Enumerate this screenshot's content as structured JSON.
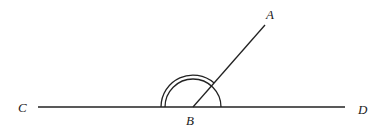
{
  "diagram": {
    "type": "angle-geometry",
    "points": {
      "A": {
        "label": "A",
        "x": 265,
        "y": 25
      },
      "B": {
        "label": "B",
        "x": 193,
        "y": 107
      },
      "C": {
        "label": "C",
        "x": 38,
        "y": 107
      },
      "D": {
        "label": "D",
        "x": 345,
        "y": 107
      }
    },
    "labels": {
      "A": "A",
      "B": "B",
      "C": "C",
      "D": "D"
    },
    "segments": [
      {
        "from": "C",
        "to": "D"
      },
      {
        "from": "B",
        "to": "A"
      }
    ],
    "arcs": [
      {
        "center": "B",
        "radius": 28,
        "from": "C-side",
        "to": "D-side",
        "style": "single"
      },
      {
        "center": "B",
        "radius": 32,
        "from": "C-side",
        "to": "BA",
        "style": "outer"
      }
    ],
    "stroke_color": "#222222",
    "background": "#ffffff"
  }
}
